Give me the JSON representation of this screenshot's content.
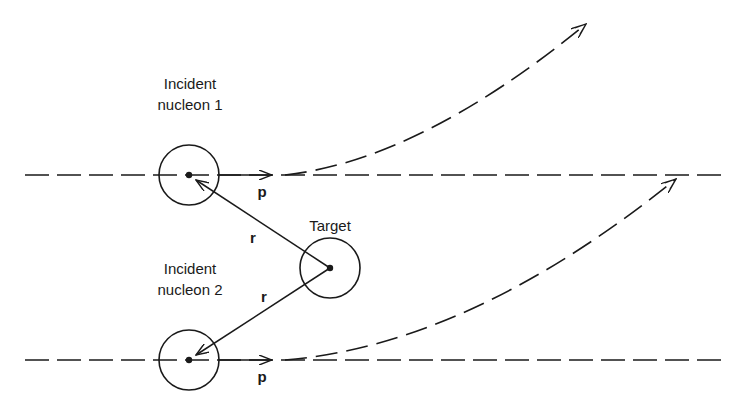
{
  "diagram": {
    "type": "nucleon-target scattering schematic",
    "labels": {
      "nucleon1_line1": "Incident",
      "nucleon1_line2": "nucleon 1",
      "target": "Target",
      "nucleon2_line1": "Incident",
      "nucleon2_line2": "nucleon 2",
      "r1": "r",
      "r2": "r",
      "p1": "p",
      "p2": "p"
    },
    "nodes": [
      {
        "id": "nucleon1",
        "label": "Incident nucleon 1",
        "cx": 189,
        "cy": 175,
        "r": 30
      },
      {
        "id": "target",
        "label": "Target",
        "cx": 330,
        "cy": 268,
        "r": 30
      },
      {
        "id": "nucleon2",
        "label": "Incident nucleon 2",
        "cx": 189,
        "cy": 360,
        "r": 30
      }
    ],
    "edges": [
      {
        "from": "target",
        "to": "nucleon1",
        "label": "r",
        "style": "solid-arrow"
      },
      {
        "from": "target",
        "to": "nucleon2",
        "label": "r",
        "style": "solid-arrow"
      },
      {
        "from": "nucleon1",
        "label": "p",
        "style": "momentum-arrow"
      },
      {
        "from": "nucleon2",
        "label": "p",
        "style": "momentum-arrow"
      }
    ],
    "trajectories": [
      {
        "id": "straight-1",
        "style": "dashed",
        "desc": "undeflected path of nucleon 1"
      },
      {
        "id": "deflected-1",
        "style": "dashed-arrow",
        "desc": "path of nucleon 1 deflected upward"
      },
      {
        "id": "straight-2",
        "style": "dashed",
        "desc": "undeflected path of nucleon 2"
      },
      {
        "id": "deflected-2",
        "style": "dashed-arrow",
        "desc": "path of nucleon 2 deflected upward"
      }
    ],
    "colors": {
      "ink": "#1a1a1a",
      "background": "#ffffff"
    }
  }
}
